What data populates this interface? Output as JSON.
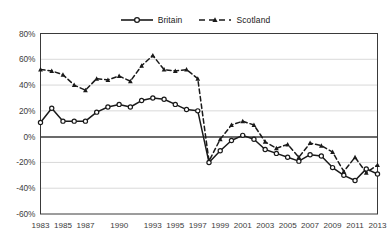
{
  "chart_data": {
    "type": "line",
    "title": "",
    "subtitle": "",
    "xlabel": "",
    "ylabel": "",
    "ylim": [
      -60,
      80
    ],
    "ytick_labels": [
      "80%",
      "60%",
      "40%",
      "20%",
      "0%",
      "-20%",
      "-40%",
      "-60%"
    ],
    "ytick_values": [
      80,
      60,
      40,
      20,
      0,
      -20,
      -40,
      -60
    ],
    "grid": true,
    "grid_axis": "y",
    "legend_position": "top-center",
    "x": [
      1983,
      1984,
      1985,
      1986,
      1987,
      1988,
      1989,
      1990,
      1991,
      1992,
      1993,
      1994,
      1995,
      1996,
      1997,
      1998,
      1999,
      2000,
      2001,
      2002,
      2003,
      2004,
      2005,
      2006,
      2007,
      2008,
      2009,
      2010,
      2011,
      2012,
      2013
    ],
    "xtick_labels": [
      "1983",
      "1985",
      "1987",
      "1990",
      "1993",
      "1995",
      "1997",
      "1999",
      "2001",
      "2003",
      "2005",
      "2007",
      "2009",
      "2011",
      "2013"
    ],
    "xtick_values": [
      1983,
      1985,
      1987,
      1990,
      1993,
      1995,
      1997,
      1999,
      2001,
      2003,
      2005,
      2007,
      2009,
      2011,
      2013
    ],
    "series": [
      {
        "name": "Britain",
        "line_style": "solid",
        "marker": "circle-open",
        "color": "#1a1a1a",
        "values": [
          11,
          22,
          12,
          12,
          12,
          19,
          23,
          25,
          23,
          28,
          30,
          29,
          25,
          21,
          20,
          -20,
          -11,
          -3,
          1,
          -2,
          -10,
          -13,
          -16,
          -19,
          -14,
          -15,
          -24,
          -30,
          -34,
          -25,
          -29
        ]
      },
      {
        "name": "Scotland",
        "line_style": "dashed",
        "marker": "triangle-filled",
        "color": "#1a1a1a",
        "values": [
          52,
          51,
          48,
          40,
          36,
          45,
          44,
          47,
          43,
          55,
          63,
          52,
          51,
          52,
          45,
          -19,
          -2,
          9,
          12,
          9,
          -4,
          -9,
          -6,
          -16,
          -5,
          -7,
          -12,
          -27,
          -16,
          -28,
          -22
        ]
      }
    ]
  },
  "legend": {
    "entries": [
      {
        "label": "Britain"
      },
      {
        "label": "Scotland"
      }
    ]
  }
}
